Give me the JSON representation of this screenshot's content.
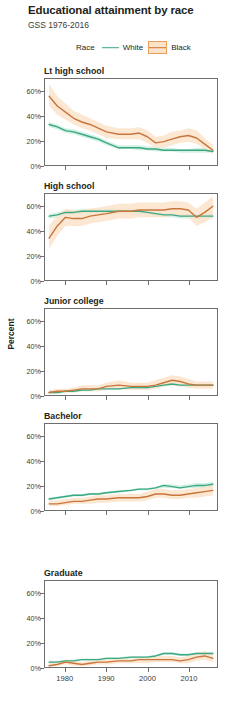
{
  "header": {
    "title": "Educational attainment by race",
    "subtitle": "GSS 1976-2016"
  },
  "legend": {
    "title": "Race",
    "entries": [
      {
        "label": "White",
        "color": "#3aa882",
        "ribbon": "#cdeede"
      },
      {
        "label": "Black",
        "color": "#c8763c",
        "ribbon": "#fbe3ca"
      }
    ]
  },
  "axes": {
    "ylabel": "Percent",
    "yticks": [
      "0%",
      "20%",
      "40%",
      "60%"
    ],
    "ytick_values": [
      0,
      20,
      40,
      60
    ],
    "xticks": [
      "1980",
      "1990",
      "2000",
      "2010"
    ],
    "xtick_values": [
      1980,
      1990,
      2000,
      2010
    ],
    "xlim": [
      1975,
      2017
    ],
    "ylim": [
      0,
      70
    ]
  },
  "chart_data": {
    "type": "line",
    "title": "Educational attainment by race",
    "subtitle": "GSS 1976-2016",
    "xlabel": "",
    "ylabel": "Percent",
    "xlim": [
      1975,
      2017
    ],
    "ylim": [
      0,
      70
    ],
    "grid": false,
    "legend_position": "top",
    "facet_variable": "Educational attainment",
    "x": [
      1976,
      1978,
      1980,
      1982,
      1984,
      1986,
      1988,
      1990,
      1993,
      1996,
      1998,
      2000,
      2002,
      2004,
      2006,
      2008,
      2010,
      2012,
      2014,
      2016
    ],
    "panels": [
      {
        "label": "Lt high school",
        "series": [
          {
            "name": "White",
            "color": "#3aa882",
            "values": [
              33,
              31,
              28,
              27,
              25,
              23,
              21,
              18,
              14,
              14,
              14,
              13,
              13,
              12,
              12,
              12,
              12,
              12,
              12,
              11
            ],
            "lower": [
              31,
              29,
              26,
              25,
              23,
              21,
              19,
              16,
              13,
              13,
              12,
              12,
              11,
              11,
              11,
              10,
              10,
              10,
              10,
              10
            ],
            "upper": [
              35,
              33,
              30,
              29,
              27,
              25,
              23,
              20,
              16,
              16,
              16,
              15,
              15,
              14,
              14,
              13,
              13,
              14,
              14,
              13
            ]
          },
          {
            "name": "Black",
            "color": "#c8763c",
            "values": [
              56,
              48,
              43,
              38,
              35,
              33,
              30,
              27,
              25,
              25,
              26,
              23,
              18,
              19,
              21,
              23,
              24,
              22,
              17,
              12
            ],
            "lower": [
              48,
              41,
              37,
              33,
              30,
              28,
              25,
              22,
              21,
              21,
              21,
              18,
              14,
              14,
              16,
              18,
              19,
              17,
              13,
              9
            ],
            "upper": [
              66,
              56,
              50,
              44,
              41,
              38,
              35,
              32,
              30,
              30,
              31,
              28,
              23,
              24,
              27,
              28,
              30,
              28,
              22,
              16
            ]
          }
        ]
      },
      {
        "label": "High school",
        "series": [
          {
            "name": "White",
            "color": "#3aa882",
            "values": [
              52,
              53,
              55,
              55,
              56,
              56,
              56,
              56,
              56,
              56,
              56,
              55,
              54,
              53,
              53,
              52,
              52,
              52,
              52,
              52
            ],
            "lower": [
              50,
              51,
              53,
              53,
              54,
              54,
              54,
              54,
              54,
              54,
              54,
              53,
              52,
              51,
              51,
              50,
              50,
              50,
              50,
              50
            ],
            "upper": [
              54,
              55,
              57,
              57,
              58,
              58,
              58,
              58,
              58,
              58,
              58,
              57,
              56,
              55,
              55,
              54,
              54,
              54,
              54,
              54
            ]
          },
          {
            "name": "Black",
            "color": "#c8763c",
            "values": [
              34,
              44,
              51,
              50,
              50,
              52,
              53,
              54,
              56,
              56,
              57,
              57,
              57,
              57,
              58,
              58,
              57,
              51,
              55,
              60
            ],
            "lower": [
              25,
              36,
              44,
              44,
              44,
              46,
              47,
              48,
              50,
              50,
              51,
              51,
              51,
              51,
              52,
              52,
              51,
              44,
              47,
              51
            ],
            "upper": [
              44,
              53,
              58,
              57,
              57,
              58,
              59,
              60,
              62,
              62,
              63,
              63,
              63,
              63,
              64,
              64,
              63,
              58,
              63,
              68
            ]
          }
        ]
      },
      {
        "label": "Junior college",
        "series": [
          {
            "name": "White",
            "color": "#3aa882",
            "values": [
              2,
              2,
              3,
              3,
              4,
              4,
              5,
              5,
              5,
              6,
              6,
              6,
              7,
              8,
              9,
              8,
              8,
              8,
              8,
              8
            ],
            "lower": [
              1,
              1,
              2,
              2,
              3,
              3,
              4,
              4,
              4,
              5,
              5,
              5,
              6,
              7,
              8,
              7,
              7,
              7,
              7,
              7
            ],
            "upper": [
              3,
              3,
              4,
              4,
              5,
              5,
              6,
              6,
              6,
              7,
              7,
              7,
              8,
              9,
              10,
              9,
              9,
              9,
              9,
              9
            ]
          },
          {
            "name": "Black",
            "color": "#c8763c",
            "values": [
              2,
              3,
              3,
              4,
              5,
              5,
              5,
              7,
              8,
              7,
              7,
              7,
              8,
              10,
              12,
              11,
              9,
              8,
              8,
              8
            ],
            "lower": [
              1,
              1,
              2,
              2,
              3,
              3,
              3,
              4,
              5,
              4,
              4,
              4,
              5,
              7,
              8,
              7,
              6,
              5,
              5,
              5
            ],
            "upper": [
              4,
              5,
              5,
              6,
              8,
              8,
              8,
              10,
              12,
              10,
              10,
              10,
              12,
              14,
              16,
              15,
              13,
              11,
              11,
              11
            ]
          }
        ]
      },
      {
        "label": "Bachelor",
        "series": [
          {
            "name": "White",
            "color": "#3aa882",
            "values": [
              9,
              10,
              11,
              12,
              12,
              13,
              13,
              14,
              15,
              16,
              17,
              17,
              18,
              20,
              19,
              18,
              19,
              20,
              20,
              21
            ],
            "lower": [
              8,
              9,
              10,
              11,
              11,
              12,
              12,
              13,
              14,
              15,
              16,
              16,
              17,
              18,
              18,
              17,
              18,
              18,
              18,
              19
            ],
            "upper": [
              10,
              11,
              12,
              13,
              13,
              14,
              14,
              15,
              16,
              17,
              18,
              18,
              19,
              21,
              21,
              20,
              21,
              22,
              22,
              23
            ]
          },
          {
            "name": "Black",
            "color": "#c8763c",
            "values": [
              5,
              5,
              6,
              7,
              7,
              8,
              9,
              9,
              10,
              10,
              10,
              11,
              13,
              13,
              12,
              12,
              13,
              14,
              15,
              16
            ],
            "lower": [
              3,
              3,
              4,
              5,
              5,
              5,
              6,
              6,
              7,
              7,
              7,
              8,
              10,
              10,
              9,
              9,
              10,
              10,
              11,
              12
            ],
            "upper": [
              8,
              8,
              9,
              10,
              10,
              11,
              12,
              12,
              13,
              13,
              13,
              15,
              17,
              17,
              16,
              16,
              17,
              18,
              19,
              21
            ]
          }
        ]
      },
      {
        "label": "Graduate",
        "series": [
          {
            "name": "White",
            "color": "#3aa882",
            "values": [
              4,
              4,
              5,
              5,
              6,
              6,
              6,
              7,
              7,
              8,
              8,
              8,
              9,
              11,
              11,
              10,
              10,
              11,
              11,
              11
            ],
            "lower": [
              3,
              3,
              4,
              4,
              5,
              5,
              5,
              6,
              6,
              7,
              7,
              7,
              8,
              10,
              10,
              9,
              9,
              10,
              10,
              10
            ],
            "upper": [
              5,
              5,
              6,
              6,
              7,
              7,
              7,
              8,
              8,
              9,
              9,
              9,
              10,
              12,
              12,
              11,
              11,
              12,
              12,
              12
            ]
          },
          {
            "name": "Black",
            "color": "#c8763c",
            "values": [
              1,
              2,
              4,
              3,
              2,
              3,
              4,
              4,
              5,
              5,
              6,
              6,
              6,
              6,
              6,
              5,
              6,
              8,
              9,
              7
            ],
            "lower": [
              0,
              1,
              2,
              1,
              1,
              1,
              2,
              2,
              3,
              3,
              3,
              3,
              4,
              4,
              4,
              3,
              3,
              5,
              6,
              4
            ],
            "upper": [
              3,
              4,
              6,
              5,
              4,
              5,
              6,
              6,
              7,
              7,
              8,
              8,
              9,
              9,
              9,
              8,
              9,
              11,
              13,
              11
            ]
          }
        ]
      }
    ]
  }
}
